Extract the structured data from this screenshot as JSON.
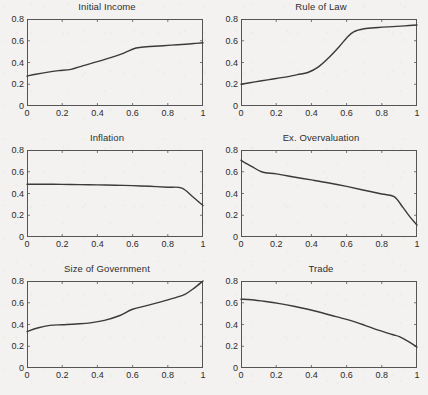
{
  "figure": {
    "background_color": "#f3f2f0",
    "line_color": "#3a3a3a",
    "axis_color": "#555555",
    "text_color": "#2b2b2b",
    "rows": 3,
    "cols": 2
  },
  "chart_data": [
    {
      "type": "line",
      "title": "Initial Income",
      "xlabel": "",
      "ylabel": "",
      "xlim": [
        0,
        1
      ],
      "ylim": [
        0,
        0.8
      ],
      "xticks": [
        0,
        0.2,
        0.4,
        0.6,
        0.8,
        1
      ],
      "xticklabels": [
        "0",
        "0.2",
        "0.4",
        "0.6",
        "0.8",
        "1"
      ],
      "yticks": [
        0,
        0.2,
        0.4,
        0.6,
        0.8
      ],
      "yticklabels": [
        "0",
        "0.2",
        "0.4",
        "0.6",
        "0.8"
      ],
      "grid": false,
      "legend": "none",
      "x": [
        0,
        0.05,
        0.12,
        0.18,
        0.25,
        0.32,
        0.4,
        0.48,
        0.55,
        0.62,
        0.68,
        0.75,
        0.82,
        0.9,
        0.96,
        1.0
      ],
      "y": [
        0.275,
        0.292,
        0.312,
        0.325,
        0.337,
        0.372,
        0.408,
        0.447,
        0.487,
        0.533,
        0.545,
        0.552,
        0.56,
        0.568,
        0.576,
        0.582
      ]
    },
    {
      "type": "line",
      "title": "Rule of Law",
      "xlabel": "",
      "ylabel": "",
      "xlim": [
        0,
        1
      ],
      "ylim": [
        0,
        0.8
      ],
      "xticks": [
        0,
        0.2,
        0.4,
        0.6,
        0.8,
        1
      ],
      "xticklabels": [
        "0",
        "0.2",
        "0.4",
        "0.6",
        "0.8",
        "1"
      ],
      "yticks": [
        0,
        0.2,
        0.4,
        0.6,
        0.8
      ],
      "yticklabels": [
        "0",
        "0.2",
        "0.4",
        "0.6",
        "0.8"
      ],
      "grid": false,
      "legend": "none",
      "x": [
        0,
        0.08,
        0.16,
        0.24,
        0.32,
        0.38,
        0.44,
        0.5,
        0.56,
        0.6,
        0.64,
        0.7,
        0.78,
        0.86,
        0.93,
        1.0
      ],
      "y": [
        0.2,
        0.222,
        0.243,
        0.263,
        0.288,
        0.308,
        0.36,
        0.447,
        0.55,
        0.625,
        0.682,
        0.71,
        0.722,
        0.73,
        0.737,
        0.745
      ]
    },
    {
      "type": "line",
      "title": "Inflation",
      "xlabel": "",
      "ylabel": "",
      "xlim": [
        0,
        1
      ],
      "ylim": [
        0,
        0.8
      ],
      "xticks": [
        0,
        0.2,
        0.4,
        0.6,
        0.8,
        1
      ],
      "xticklabels": [
        "0",
        "0.2",
        "0.4",
        "0.6",
        "0.8",
        "1"
      ],
      "yticks": [
        0,
        0.2,
        0.4,
        0.6,
        0.8
      ],
      "yticklabels": [
        "0",
        "0.2",
        "0.4",
        "0.6",
        "0.8"
      ],
      "grid": false,
      "legend": "none",
      "x": [
        0,
        0.1,
        0.2,
        0.3,
        0.4,
        0.5,
        0.6,
        0.7,
        0.8,
        0.88,
        0.94,
        1.0
      ],
      "y": [
        0.485,
        0.485,
        0.484,
        0.482,
        0.479,
        0.476,
        0.472,
        0.466,
        0.458,
        0.45,
        0.372,
        0.29
      ]
    },
    {
      "type": "line",
      "title": "Ex. Overvaluation",
      "xlabel": "",
      "ylabel": "",
      "xlim": [
        0,
        1
      ],
      "ylim": [
        0,
        0.8
      ],
      "xticks": [
        0,
        0.2,
        0.4,
        0.6,
        0.8,
        1
      ],
      "xticklabels": [
        "0",
        "0.2",
        "0.4",
        "0.6",
        "0.8",
        "1"
      ],
      "yticks": [
        0,
        0.2,
        0.4,
        0.6,
        0.8
      ],
      "yticklabels": [
        "0",
        "0.2",
        "0.4",
        "0.6",
        "0.8"
      ],
      "grid": false,
      "legend": "none",
      "x": [
        0,
        0.06,
        0.12,
        0.2,
        0.3,
        0.4,
        0.5,
        0.6,
        0.7,
        0.8,
        0.87,
        0.92,
        0.96,
        1.0
      ],
      "y": [
        0.705,
        0.65,
        0.598,
        0.58,
        0.552,
        0.525,
        0.497,
        0.465,
        0.43,
        0.395,
        0.372,
        0.272,
        0.185,
        0.11
      ]
    },
    {
      "type": "line",
      "title": "Size of Government",
      "xlabel": "",
      "ylabel": "",
      "xlim": [
        0,
        1
      ],
      "ylim": [
        0,
        0.8
      ],
      "xticks": [
        0,
        0.2,
        0.4,
        0.6,
        0.8,
        1
      ],
      "xticklabels": [
        "0",
        "0.2",
        "0.4",
        "0.6",
        "0.8",
        "1"
      ],
      "yticks": [
        0,
        0.2,
        0.4,
        0.6,
        0.8
      ],
      "yticklabels": [
        "0",
        "0.2",
        "0.4",
        "0.6",
        "0.8"
      ],
      "grid": false,
      "legend": "none",
      "x": [
        0,
        0.06,
        0.13,
        0.2,
        0.28,
        0.36,
        0.44,
        0.52,
        0.6,
        0.68,
        0.76,
        0.84,
        0.9,
        0.95,
        1.0
      ],
      "y": [
        0.335,
        0.368,
        0.392,
        0.398,
        0.405,
        0.415,
        0.438,
        0.478,
        0.54,
        0.573,
        0.608,
        0.645,
        0.68,
        0.735,
        0.8
      ]
    },
    {
      "type": "line",
      "title": "Trade",
      "xlabel": "",
      "ylabel": "",
      "xlim": [
        0,
        1
      ],
      "ylim": [
        0,
        0.8
      ],
      "xticks": [
        0,
        0.2,
        0.4,
        0.6,
        0.8,
        1
      ],
      "xticklabels": [
        "0",
        "0.2",
        "0.4",
        "0.6",
        "0.8",
        "1"
      ],
      "yticks": [
        0,
        0.2,
        0.4,
        0.6,
        0.8
      ],
      "yticklabels": [
        "0",
        "0.2",
        "0.4",
        "0.6",
        "0.8"
      ],
      "grid": false,
      "legend": "none",
      "x": [
        0,
        0.06,
        0.14,
        0.22,
        0.3,
        0.38,
        0.46,
        0.54,
        0.62,
        0.7,
        0.78,
        0.86,
        0.9,
        0.95,
        1.0
      ],
      "y": [
        0.632,
        0.628,
        0.612,
        0.592,
        0.568,
        0.54,
        0.508,
        0.472,
        0.438,
        0.395,
        0.348,
        0.308,
        0.288,
        0.245,
        0.192
      ]
    }
  ]
}
